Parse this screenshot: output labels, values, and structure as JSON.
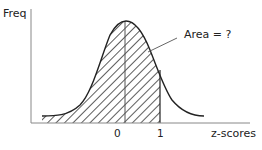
{
  "diagram": {
    "y_axis_label": "Freq",
    "x_axis_label": "z-scores",
    "annotation": "Area = ?",
    "ticks": [
      {
        "label": "0",
        "z": 0
      },
      {
        "label": "1",
        "z": 1
      }
    ],
    "shaded_region": {
      "from": "-inf",
      "to": 1
    },
    "colors": {
      "axis": "#888888",
      "curve": "#222222",
      "hatch": "#333333",
      "background": "#ffffff"
    }
  }
}
